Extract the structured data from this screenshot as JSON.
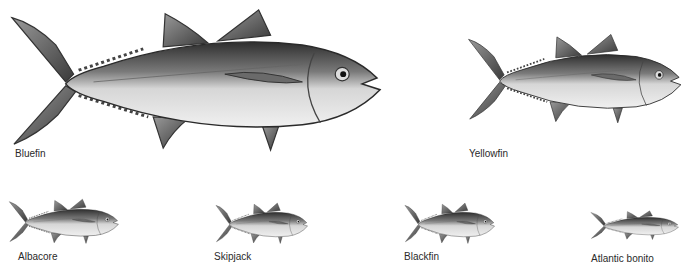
{
  "figure": {
    "species": [
      {
        "name": "Bluefin",
        "size": "large"
      },
      {
        "name": "Yellowfin",
        "size": "medium"
      },
      {
        "name": "Albacore",
        "size": "small"
      },
      {
        "name": "Skipjack",
        "size": "small"
      },
      {
        "name": "Blackfin",
        "size": "small"
      },
      {
        "name": "Atlantic bonito",
        "size": "small"
      }
    ]
  },
  "colors": {
    "background": "#ffffff",
    "label": "#2a2a2a",
    "fish_dark": "#3a3a3a",
    "fish_mid": "#8a8a8a",
    "fish_light": "#e6e6e6"
  }
}
